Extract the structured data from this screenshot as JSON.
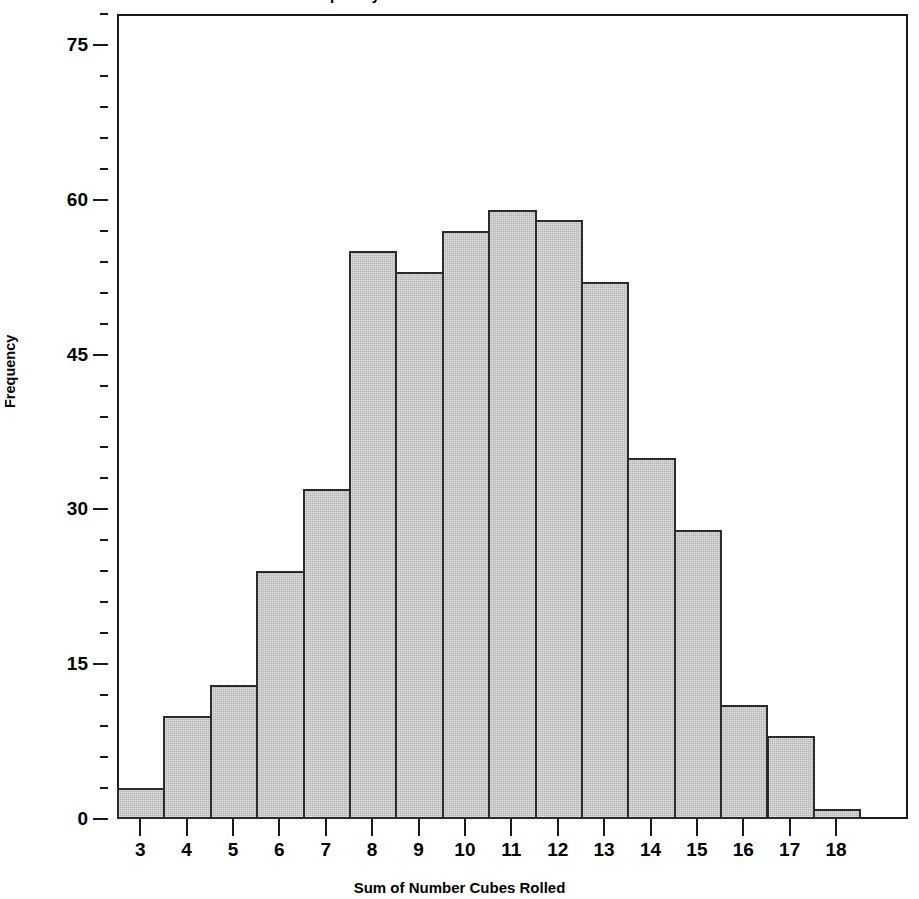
{
  "chart_data": {
    "type": "bar",
    "title": "Frequency of Sums of Two Number Cubes",
    "xlabel": "Sum of Number Cubes Rolled",
    "ylabel": "Frequency",
    "categories": [
      "3",
      "4",
      "5",
      "6",
      "7",
      "8",
      "9",
      "10",
      "11",
      "12",
      "13",
      "14",
      "15",
      "16",
      "17",
      "18"
    ],
    "values": [
      3,
      10,
      13,
      24,
      32,
      55,
      53,
      57,
      59,
      58,
      52,
      35,
      28,
      11,
      8,
      1
    ],
    "ylim": [
      0,
      78
    ],
    "yticks": [
      0,
      15,
      30,
      45,
      60,
      75
    ],
    "ytick_labels": [
      "0",
      "15",
      "30",
      "45",
      "60",
      "75"
    ],
    "y_minor_tick_interval": 3,
    "grid": false,
    "legend": null,
    "bar_fill_color": "#b4b4b4",
    "bar_edge_color": "#2b2b2b",
    "axis_color": "#1a1a1a",
    "background_color": "#ffffff"
  }
}
